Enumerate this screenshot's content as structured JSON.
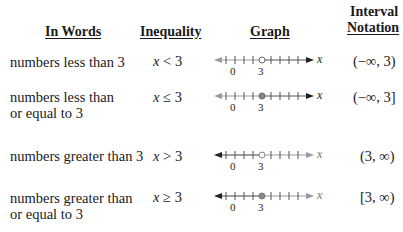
{
  "headers": {
    "words": "In Words",
    "inequality": "Inequality",
    "graph": "Graph",
    "interval_line1": "Interval",
    "interval_line2": "Notation"
  },
  "rows": [
    {
      "words_line1": "numbers less than 3",
      "words_line2": "",
      "ineq_var": "x",
      "ineq_op": "<",
      "ineq_val": "3",
      "interval": "(−∞, 3)",
      "graph": {
        "endpoint": "open",
        "direction": "left",
        "tick_label_0": "0",
        "tick_label_3": "3",
        "axis_label": "x"
      }
    },
    {
      "words_line1": "numbers less than",
      "words_line2": "or equal to 3",
      "ineq_var": "x",
      "ineq_op": "≤",
      "ineq_val": "3",
      "interval": "(−∞, 3]",
      "graph": {
        "endpoint": "closed",
        "direction": "left",
        "tick_label_0": "0",
        "tick_label_3": "3",
        "axis_label": "x"
      }
    },
    {
      "words_line1": "numbers greater than 3",
      "words_line2": "",
      "ineq_var": "x",
      "ineq_op": ">",
      "ineq_val": "3",
      "interval": "(3, ∞)",
      "graph": {
        "endpoint": "open",
        "direction": "right",
        "tick_label_0": "0",
        "tick_label_3": "3",
        "axis_label": "x"
      }
    },
    {
      "words_line1": "numbers greater than",
      "words_line2": "or equal to 3",
      "ineq_var": "x",
      "ineq_op": "≥",
      "ineq_val": "3",
      "interval": "[3, ∞)",
      "graph": {
        "endpoint": "closed",
        "direction": "right",
        "tick_label_0": "0",
        "tick_label_3": "3",
        "axis_label": "x"
      }
    }
  ],
  "colors": {
    "text": "#1a1a1a",
    "shaded_line": "#333333",
    "unshaded_line": "#9a9a9a"
  }
}
